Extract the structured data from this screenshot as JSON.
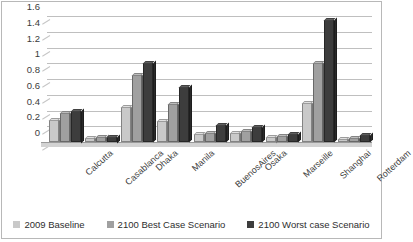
{
  "chart_data": {
    "type": "bar",
    "title": "",
    "subtitle": "",
    "xlabel": "",
    "ylabel": "",
    "ylim": [
      0,
      1.6
    ],
    "grid": true,
    "legend_position": "bottom",
    "style": "3d-clustered-column-grayscale",
    "categories": [
      "Calcutta",
      "Casablanca",
      "Dhaka",
      "Manila",
      "BuenosAires",
      "Osaka",
      "Marseille",
      "Shanghai",
      "Rotterdam"
    ],
    "y_ticks": [
      "0",
      "0.2",
      "0.4",
      "0.6",
      "0.8",
      "1",
      "1.2",
      "1.4",
      "1.6"
    ],
    "y_tick_values": [
      0,
      0.2,
      0.4,
      0.6,
      0.8,
      1,
      1.2,
      1.4,
      1.6
    ],
    "series": [
      {
        "name": "2009 Baseline",
        "color": "#c9c9c9",
        "values": [
          0.28,
          0.05,
          0.45,
          0.27,
          0.1,
          0.12,
          0.07,
          0.5,
          0.04
        ]
      },
      {
        "name": "2100 Best Case Scenario",
        "color": "#a0a0a0",
        "values": [
          0.37,
          0.06,
          0.85,
          0.48,
          0.12,
          0.14,
          0.08,
          1.0,
          0.05
        ]
      },
      {
        "name": "2100 Worst case Scenario",
        "color": "#3d3d3d",
        "values": [
          0.4,
          0.07,
          1.0,
          0.7,
          0.21,
          0.19,
          0.1,
          1.55,
          0.09
        ]
      }
    ]
  },
  "legend": {
    "items": [
      {
        "label": "2009 Baseline",
        "color": "#c9c9c9"
      },
      {
        "label": "2100 Best Case Scenario",
        "color": "#a0a0a0"
      },
      {
        "label": "2100 Worst case Scenario",
        "color": "#3d3d3d"
      }
    ]
  }
}
